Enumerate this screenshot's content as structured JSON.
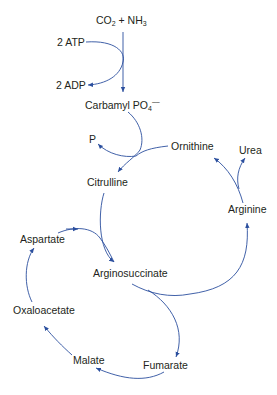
{
  "diagram": {
    "colors": {
      "arrow": "#2b4f9e",
      "text": "#231f20"
    },
    "nodes": {
      "co2": "CO",
      "co2_sub": "2",
      "plus": " + NH",
      "nh3_sub": "3",
      "atp": "2 ATP",
      "adp": "2 ADP",
      "carbamyl": "Carbamyl PO",
      "carbamyl_sub": "4",
      "carbamyl_sup": "––",
      "p": "P",
      "ornithine": "Ornithine",
      "citrulline": "Citrulline",
      "urea": "Urea",
      "arginine": "Arginine",
      "aspartate": "Aspartate",
      "arginosuccinate": "Arginosuccinate",
      "oxaloacetate": "Oxaloacetate",
      "malate": "Malate",
      "fumarate": "Fumarate"
    },
    "edges": [
      {
        "from": "CO2 + NH3",
        "to": "Carbamyl PO4"
      },
      {
        "from": "2 ATP",
        "to": "2 ADP"
      },
      {
        "from": "Carbamyl PO4",
        "to": "Citrulline"
      },
      {
        "from": "Ornithine",
        "to": "Citrulline"
      },
      {
        "from": "Carbamyl PO4",
        "to": "P"
      },
      {
        "from": "Citrulline",
        "to": "Arginosuccinate"
      },
      {
        "from": "Aspartate",
        "to": "Arginosuccinate"
      },
      {
        "from": "Arginosuccinate",
        "to": "Arginine"
      },
      {
        "from": "Arginosuccinate",
        "to": "Fumarate"
      },
      {
        "from": "Arginine",
        "to": "Ornithine"
      },
      {
        "from": "Arginine",
        "to": "Urea"
      },
      {
        "from": "Fumarate",
        "to": "Malate"
      },
      {
        "from": "Malate",
        "to": "Oxaloacetate"
      },
      {
        "from": "Oxaloacetate",
        "to": "Aspartate"
      }
    ]
  }
}
